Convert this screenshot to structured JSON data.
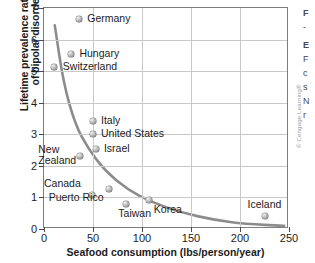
{
  "chart_data": {
    "type": "scatter",
    "title": "",
    "xlabel": "Seafood consumption (lbs/person/year)",
    "ylabel": "Lifetime prevalence rates (%) of bipolar disorder",
    "ylabel_line1": "Lifetime prevalence rates (%)",
    "ylabel_line2": "of bipolar disorder",
    "xlim": [
      0,
      250
    ],
    "ylim": [
      0,
      7
    ],
    "xticks": [
      "0",
      "50",
      "100",
      "150",
      "200",
      "250"
    ],
    "yticks": [
      "0",
      "1",
      "2",
      "3",
      "4",
      "5",
      "6",
      "7"
    ],
    "grid": true,
    "legend": "none",
    "points": [
      {
        "label": "Germany",
        "x": 36,
        "y": 6.65,
        "label_dx": 8,
        "label_dy": -6
      },
      {
        "label": "Hungary",
        "x": 28,
        "y": 5.53,
        "label_dx": 8,
        "label_dy": -6
      },
      {
        "label": "Switzerland",
        "x": 10,
        "y": 5.12,
        "label_dx": 9,
        "label_dy": -6
      },
      {
        "label": "Italy",
        "x": 50,
        "y": 3.42,
        "label_dx": 8,
        "label_dy": -6
      },
      {
        "label": "United States",
        "x": 50,
        "y": 3.01,
        "label_dx": 8,
        "label_dy": -6
      },
      {
        "label": "Israel",
        "x": 53,
        "y": 2.54,
        "label_dx": 8,
        "label_dy": -6
      },
      {
        "label": "New Zealand",
        "x": 37,
        "y": 2.31,
        "label_dx": -42,
        "label_dy": -12,
        "two_line": true,
        "line1": "New",
        "line2": "Zealand"
      },
      {
        "label": "Canada",
        "x": 49,
        "y": 1.08,
        "label_dx": -48,
        "label_dy": -17
      },
      {
        "label": "Puerto Rico",
        "x": 66,
        "y": 1.27,
        "label_dx": -60,
        "label_dy": 3
      },
      {
        "label": "Taiwan",
        "x": 84,
        "y": 0.79,
        "label_dx": -8,
        "label_dy": 4
      },
      {
        "label": "Korea",
        "x": 107,
        "y": 0.92,
        "label_dx": 5,
        "label_dy": 4
      },
      {
        "label": "Iceland",
        "x": 226,
        "y": 0.41,
        "label_dx": -18,
        "label_dy": -17
      }
    ],
    "trend": {
      "description": "decreasing exponential-like best-fit curve",
      "color": "#8c8c8c",
      "path_points": [
        {
          "x": 11,
          "y": 6.45
        },
        {
          "x": 20,
          "y": 4.6
        },
        {
          "x": 32,
          "y": 3.3
        },
        {
          "x": 45,
          "y": 2.55
        },
        {
          "x": 62,
          "y": 1.85
        },
        {
          "x": 85,
          "y": 1.25
        },
        {
          "x": 110,
          "y": 0.85
        },
        {
          "x": 140,
          "y": 0.52
        },
        {
          "x": 175,
          "y": 0.28
        },
        {
          "x": 205,
          "y": 0.16
        },
        {
          "x": 245,
          "y": 0.1
        }
      ]
    }
  },
  "credit": "© Cengage Learning®",
  "edge_text": [
    "F",
    "-",
    "E",
    "F",
    "c",
    "s",
    "N",
    "r"
  ],
  "colors": {
    "marker": "#9a9a9a",
    "curve": "#8c8c8c",
    "grid": "#c9c9c9",
    "axis": "#7d7d7d",
    "text": "#1b1b1b"
  }
}
